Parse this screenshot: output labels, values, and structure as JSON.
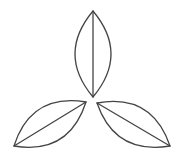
{
  "diagram": {
    "stroke_color": "#444444",
    "background": "#ffffff",
    "leaves": [
      {
        "name": "top-leaf",
        "tip_a": [
          93,
          11
        ],
        "tip_b": [
          93,
          97
        ],
        "control_left": [
          57,
          54
        ],
        "control_right": [
          129,
          54
        ]
      },
      {
        "name": "bottom-left-leaf",
        "tip_a": [
          86,
          102
        ],
        "tip_b": [
          14,
          146
        ],
        "control_left": [
          69,
          155
        ],
        "control_right": [
          31,
          93
        ]
      },
      {
        "name": "bottom-right-leaf",
        "tip_a": [
          97,
          103
        ],
        "tip_b": [
          170,
          146
        ],
        "control_left": [
          115,
          155
        ],
        "control_right": [
          152,
          93
        ]
      }
    ]
  }
}
